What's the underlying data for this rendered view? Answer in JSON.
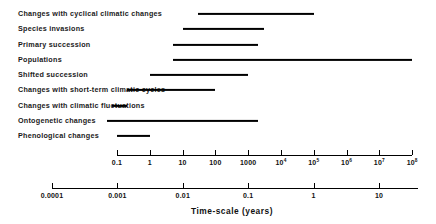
{
  "chart_data": {
    "type": "bar",
    "title": "",
    "subtitle": "",
    "xlabel": "Time-scale (years)",
    "ylabel": "",
    "orientation": "horizontal",
    "bar_style": "range-span",
    "grid": false,
    "legend": null,
    "xscale": "log",
    "categories": [
      "Changes with cyclical climatic changes",
      "Species invasions",
      "Primary succession",
      "Populations",
      "Shifted succession",
      "Changes with short-term climatic cycles",
      "Changes with climatic fluctuations",
      "Ontogenetic changes",
      "Phenological changes"
    ],
    "ranges": [
      {
        "label": "Changes with cyclical climatic changes",
        "start": 30,
        "end": 100000
      },
      {
        "label": "Species invasions",
        "start": 10,
        "end": 3000
      },
      {
        "label": "Primary succession",
        "start": 5,
        "end": 2000
      },
      {
        "label": "Populations",
        "start": 5,
        "end": 100000000
      },
      {
        "label": "Shifted succession",
        "start": 1,
        "end": 1000
      },
      {
        "label": "Changes with short-term climatic cycles",
        "start": 0.2,
        "end": 100
      },
      {
        "label": "Changes with climatic fluctuations",
        "start": 0.07,
        "end": 0.2
      },
      {
        "label": "Ontogenetic changes",
        "start": 0.05,
        "end": 2000
      },
      {
        "label": "Phenological changes",
        "start": 0.1,
        "end": 1
      }
    ],
    "axes": [
      {
        "name": "upper-axis",
        "units": "years",
        "tick_values": [
          0.1,
          1,
          10,
          100,
          1000,
          10000,
          100000,
          1000000,
          10000000,
          100000000
        ],
        "tick_labels": [
          "0.1",
          "1",
          "10",
          "100",
          "1000",
          "10⁴",
          "10⁵",
          "10⁶",
          "10⁷",
          "10⁸"
        ],
        "tick_mantissa": [
          "0.1",
          "1",
          "10",
          "100",
          "1000",
          "10",
          "10",
          "10",
          "10",
          "10"
        ],
        "tick_exponent": [
          "",
          "",
          "",
          "",
          "",
          "4",
          "5",
          "6",
          "7",
          "8"
        ],
        "xlim": [
          0.1,
          100000000
        ]
      },
      {
        "name": "lower-axis",
        "units": "years",
        "tick_values": [
          0.0001,
          0.001,
          0.01,
          0.1,
          1,
          10
        ],
        "tick_labels": [
          "0.0001",
          "0.001",
          "0.01",
          "0.1",
          "1",
          "10"
        ],
        "tick_mantissa": [
          "0.0001",
          "0.001",
          "0.01",
          "0.1",
          "1",
          "10"
        ],
        "tick_exponent": [
          "",
          "",
          "",
          "",
          "",
          ""
        ],
        "xlim": [
          0.0001,
          40
        ]
      }
    ],
    "colors": {
      "bar": "#000000",
      "axis": "#000000",
      "text": "#000000",
      "background": "#ffffff"
    }
  }
}
